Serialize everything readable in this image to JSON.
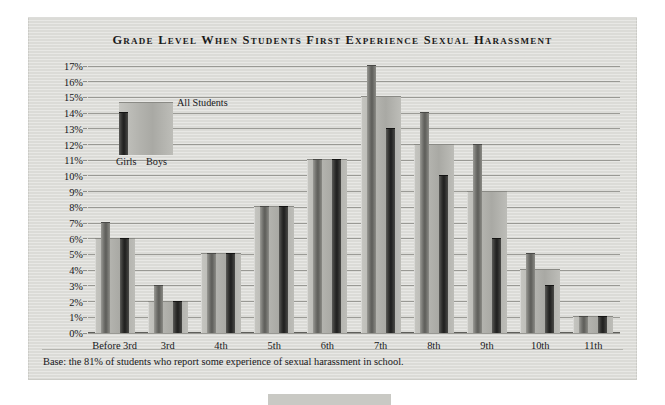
{
  "title": "Grade Level When Students First Experience Sexual Harassment",
  "footnote": "Base: the 81% of students who report some experience of sexual harassment in school.",
  "legend": {
    "all_label": "All Students",
    "girls_label": "Girls",
    "boys_label": "Boys"
  },
  "colors": {
    "panel_background": "#dededa",
    "all_students_bar": "#b3b3ae",
    "girls_bar": "#6e6e6a",
    "boys_bar": "#2e2e2c",
    "gridline": "#8d8d88",
    "text": "#17171a"
  },
  "chart_data": {
    "type": "bar",
    "title": "Grade Level When Students First Experience Sexual Harassment",
    "xlabel": "",
    "ylabel": "",
    "ylim": [
      0,
      17
    ],
    "ytick_step": 1,
    "grid": true,
    "legend_position": "inside-top-left",
    "ytick_labels": [
      "0%",
      "1%",
      "2%",
      "3%",
      "4%",
      "5%",
      "6%",
      "7%",
      "8%",
      "9%",
      "10%",
      "11%",
      "12%",
      "13%",
      "14%",
      "15%",
      "16%",
      "17%"
    ],
    "categories": [
      "Before 3rd",
      "3rd",
      "4th",
      "5th",
      "6th",
      "7th",
      "8th",
      "9th",
      "10th",
      "11th"
    ],
    "series": [
      {
        "name": "All Students",
        "values": [
          6,
          2,
          5,
          8,
          11,
          15,
          12,
          9,
          4,
          1
        ]
      },
      {
        "name": "Girls",
        "values": [
          7,
          3,
          5,
          8,
          11,
          17,
          14,
          12,
          5,
          1
        ]
      },
      {
        "name": "Boys",
        "values": [
          6,
          2,
          5,
          8,
          11,
          13,
          10,
          6,
          3,
          1
        ]
      }
    ],
    "annotations": [
      "Base: the 81% of students who report some experience of sexual harassment in school."
    ]
  }
}
